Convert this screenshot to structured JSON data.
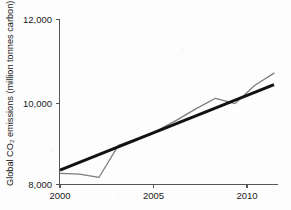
{
  "chart_data": {
    "type": "line",
    "title": "",
    "subtitle": "",
    "xlabel": "",
    "ylabel": "Global CO₂ emissions (million tonnes carbon)",
    "xlim": [
      2000,
      2011
    ],
    "ylim": [
      8000,
      12000
    ],
    "grid": false,
    "legend_position": "none",
    "x_ticks": [
      "2000",
      "2005",
      "2010"
    ],
    "x_tick_values": [
      2000,
      2005,
      2010
    ],
    "y_ticks": [
      "8,000",
      "10,000",
      "12,000"
    ],
    "y_tick_values": [
      8000,
      10000,
      12000
    ],
    "x": [
      2000,
      2001,
      2002,
      2003,
      2004,
      2005,
      2006,
      2007,
      2008,
      2009,
      2010,
      2011
    ],
    "series": [
      {
        "name": "Global CO2 emissions",
        "style": "actual",
        "color": "#7b7c80",
        "values": [
          8270,
          8250,
          8170,
          8950,
          9120,
          9310,
          9560,
          9840,
          10090,
          9960,
          10400,
          10700
        ]
      },
      {
        "name": "Linear trend",
        "style": "trend",
        "color": "#121212",
        "values": [
          8350,
          8538,
          8726,
          8914,
          9102,
          9290,
          9478,
          9666,
          9854,
          10042,
          10230,
          10420
        ]
      }
    ],
    "annotations": []
  },
  "axis": {
    "y_tick_0": "8,000",
    "y_tick_1": "10,000",
    "y_tick_2": "12,000",
    "x_tick_0": "2000",
    "x_tick_1": "2005",
    "x_tick_2": "2010",
    "y_axis_title": "Global CO₂ emissions (million tonnes carbon)"
  },
  "colors": {
    "background": "#fdfdfd",
    "axis": "#55565a",
    "actual_line": "#7b7c80",
    "trend_line": "#121212",
    "text": "#1b1b1b"
  }
}
